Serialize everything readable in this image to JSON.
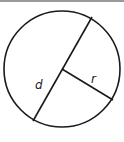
{
  "diagram": {
    "labels": {
      "diameter": "d",
      "radius": "r"
    },
    "geometry": {
      "center": [
        62,
        69
      ],
      "radius": 58,
      "diameter_start": [
        92,
        17
      ],
      "diameter_end": [
        33,
        121
      ],
      "radius_end": [
        113,
        100
      ]
    },
    "colors": {
      "stroke": "#1a1a1a",
      "topbar": "#9a9a9a",
      "background": "#ffffff"
    }
  }
}
